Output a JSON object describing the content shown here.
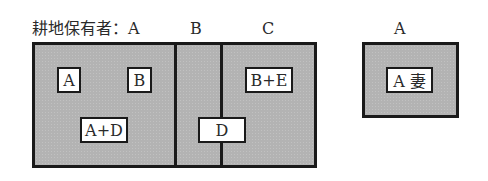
{
  "labels": {
    "holder_prefix": "耕地保有者：A",
    "col_b": "B",
    "col_c": "C",
    "right_holder": "A"
  },
  "main_field": {
    "plots": [
      {
        "owner": "A",
        "tags": [
          "A",
          "B",
          "A+D"
        ]
      },
      {
        "owner": "B",
        "tags": []
      },
      {
        "owner": "C",
        "tags": [
          "B+E"
        ]
      }
    ],
    "shared_tag": "D"
  },
  "right_field": {
    "owner": "A",
    "tags": [
      "A 妻"
    ]
  },
  "colors": {
    "field_fill": "#b3b3b3",
    "border": "#1a1a1a",
    "tag_fill": "#ffffff"
  }
}
